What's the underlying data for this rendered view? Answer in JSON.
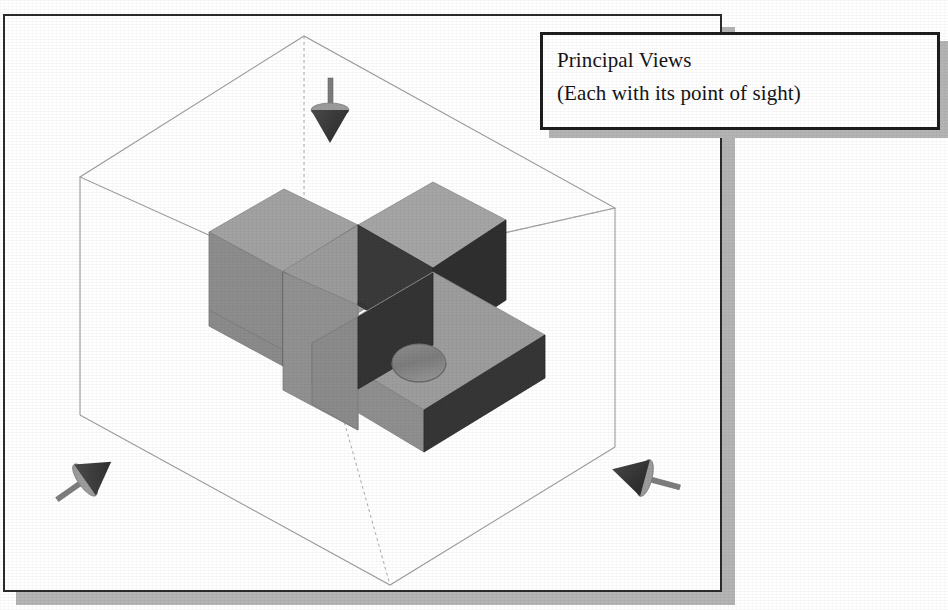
{
  "figure": {
    "kind": "isometric-technical-illustration",
    "background_color": "#ffffff"
  },
  "callout": {
    "name": "principal-views-callout",
    "line1": "Principal Views",
    "line2": "(Each with its point of sight)",
    "border_color": "#1d1d1d",
    "fill_color": "#ffffff",
    "shadow_color": "#b4b4b4"
  },
  "page_frame": {
    "border_color": "#2b2b2b",
    "shadow_color": "#b4b4b4"
  },
  "glass_box": {
    "label": "transparent projection box",
    "line_color": "#9a9a9a",
    "dashed_axis_color": "#a8a8a8",
    "vertices": {
      "top": [
        304,
        36
      ],
      "left": [
        80,
        177
      ],
      "right": [
        615,
        208
      ],
      "center_top": [
        304,
        278
      ],
      "bottom": [
        390,
        585
      ],
      "left_bottom": [
        80,
        415
      ],
      "right_bottom": [
        615,
        447
      ]
    }
  },
  "part": {
    "name": "u-bracket",
    "top_face_color": "#9d9d9d",
    "side_face_color": "#8b8b8b",
    "front_face_color": "#3a3a3a",
    "dark_face_color": "#333333",
    "hole": {
      "name": "through-hole",
      "center": [
        419,
        363
      ],
      "rx": 27,
      "ry": 19,
      "bore_color": "#7e7e7e"
    }
  },
  "sight_arrows": [
    {
      "name": "point-of-sight-top",
      "direction": "down",
      "position": [
        331,
        90
      ],
      "cone_color": "#3d3d3d",
      "cap_color": "#9a9a9a",
      "shaft_color": "#7d7d7d"
    },
    {
      "name": "point-of-sight-front-left",
      "direction": "up-right",
      "position": [
        85,
        478
      ],
      "cone_color": "#3d3d3d",
      "cap_color": "#9a9a9a",
      "shaft_color": "#7d7d7d"
    },
    {
      "name": "point-of-sight-right",
      "direction": "left",
      "position": [
        640,
        478
      ],
      "cone_color": "#3d3d3d",
      "cap_color": "#9a9a9a",
      "shaft_color": "#7d7d7d"
    }
  ]
}
